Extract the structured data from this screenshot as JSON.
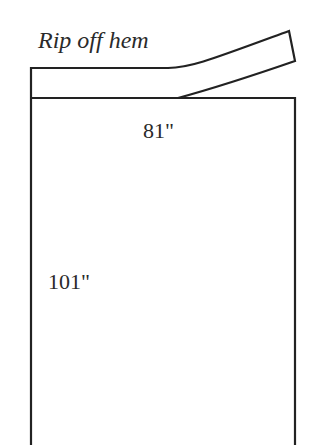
{
  "diagram": {
    "title": "Rip off hem",
    "width_label": "81\"",
    "length_label": "101\"",
    "stroke_color": "#222222",
    "background": "#ffffff"
  }
}
